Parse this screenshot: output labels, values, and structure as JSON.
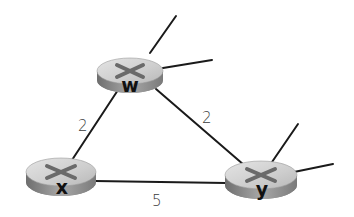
{
  "diagram": {
    "type": "network-graph",
    "colors": {
      "link": "#1a1a1a",
      "router_top": "#d2d2d2",
      "router_side": "#8e8e8e",
      "router_x_mark": "#6a6a6a",
      "node_label": "#111111",
      "edge_label": "#3a3a3a"
    },
    "nodes": [
      {
        "id": "w",
        "label": "w",
        "cx": 130,
        "cy": 72,
        "rx": 33,
        "ry": 13
      },
      {
        "id": "x",
        "label": "x",
        "cx": 61,
        "cy": 174,
        "rx": 35,
        "ry": 14
      },
      {
        "id": "y",
        "label": "y",
        "cx": 261,
        "cy": 177,
        "rx": 36,
        "ry": 14
      }
    ],
    "edges": [
      {
        "from": "w",
        "to": "x",
        "cost": "2"
      },
      {
        "from": "w",
        "to": "y",
        "cost": "2"
      },
      {
        "from": "x",
        "to": "y",
        "cost": "5"
      }
    ],
    "stub_links": [
      {
        "node": "w",
        "count": 2
      },
      {
        "node": "y",
        "count": 2
      }
    ]
  }
}
